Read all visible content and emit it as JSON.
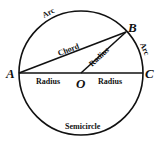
{
  "diagram": {
    "points": {
      "A": "A",
      "B": "B",
      "C": "C",
      "O": "O"
    },
    "labels": {
      "arc_top": "Arc",
      "arc_right": "Arc",
      "chord": "Chord",
      "radius_ob": "Radius",
      "radius_ao": "Radius",
      "radius_oc": "Radius",
      "semicircle": "Semicircle"
    },
    "colors": {
      "stroke": "#111111",
      "background": "#ffffff"
    }
  }
}
